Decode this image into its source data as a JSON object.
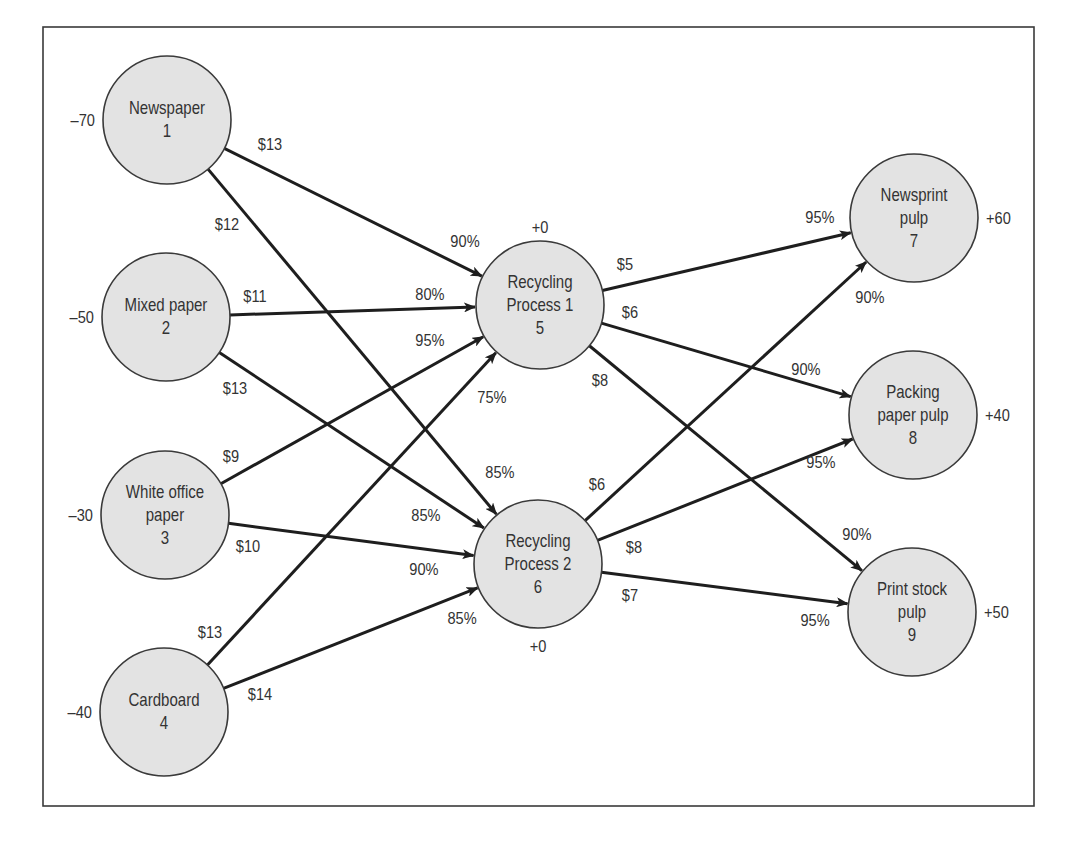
{
  "diagram": {
    "frame": {
      "x": 43,
      "y": 27,
      "width": 991,
      "height": 779
    },
    "colors": {
      "node_fill": "#e3e3e3",
      "stroke": "#3a3a3a",
      "edge": "#1e1e1e",
      "text": "#333333"
    },
    "node_radius": 64,
    "nodes": [
      {
        "id": 1,
        "lines": [
          "Newspaper",
          "1"
        ],
        "x": 167,
        "y": 120,
        "supply": "–70",
        "supply_pos": "left"
      },
      {
        "id": 2,
        "lines": [
          "Mixed paper",
          "2"
        ],
        "x": 166,
        "y": 317,
        "supply": "–50",
        "supply_pos": "left"
      },
      {
        "id": 3,
        "lines": [
          "White office",
          "paper",
          "3"
        ],
        "x": 165,
        "y": 515,
        "supply": "–30",
        "supply_pos": "left"
      },
      {
        "id": 4,
        "lines": [
          "Cardboard",
          "4"
        ],
        "x": 164,
        "y": 712,
        "supply": "–40",
        "supply_pos": "left"
      },
      {
        "id": 5,
        "lines": [
          "Recycling",
          "Process 1",
          "5"
        ],
        "x": 540,
        "y": 305,
        "supply": "+0",
        "supply_pos": "top"
      },
      {
        "id": 6,
        "lines": [
          "Recycling",
          "Process 2",
          "6"
        ],
        "x": 538,
        "y": 564,
        "supply": "+0",
        "supply_pos": "bottom"
      },
      {
        "id": 7,
        "lines": [
          "Newsprint",
          "pulp",
          "7"
        ],
        "x": 914,
        "y": 218,
        "supply": "+60",
        "supply_pos": "right"
      },
      {
        "id": 8,
        "lines": [
          "Packing",
          "paper pulp",
          "8"
        ],
        "x": 913,
        "y": 415,
        "supply": "+40",
        "supply_pos": "right"
      },
      {
        "id": 9,
        "lines": [
          "Print stock",
          "pulp",
          "9"
        ],
        "x": 912,
        "y": 612,
        "supply": "+50",
        "supply_pos": "right"
      }
    ],
    "edges": [
      {
        "from": 1,
        "to": 5,
        "cost": "$13",
        "yield": "90%",
        "cost_xy": [
          270,
          150
        ],
        "yield_xy": [
          465,
          247
        ]
      },
      {
        "from": 1,
        "to": 6,
        "cost": "$12",
        "yield": "85%",
        "cost_xy": [
          227,
          230
        ],
        "yield_xy": [
          500,
          478
        ]
      },
      {
        "from": 2,
        "to": 5,
        "cost": "$11",
        "yield": "80%",
        "cost_xy": [
          255,
          302
        ],
        "yield_xy": [
          430,
          300
        ]
      },
      {
        "from": 2,
        "to": 6,
        "cost": "$13",
        "yield": "85%",
        "cost_xy": [
          235,
          394
        ],
        "yield_xy": [
          426,
          521
        ]
      },
      {
        "from": 3,
        "to": 5,
        "cost": "$9",
        "yield": "95%",
        "cost_xy": [
          231,
          462
        ],
        "yield_xy": [
          430,
          346
        ]
      },
      {
        "from": 3,
        "to": 6,
        "cost": "$10",
        "yield": "90%",
        "cost_xy": [
          248,
          552
        ],
        "yield_xy": [
          424,
          575
        ]
      },
      {
        "from": 4,
        "to": 5,
        "cost": "$13",
        "yield": "75%",
        "cost_xy": [
          210,
          638
        ],
        "yield_xy": [
          492,
          403
        ]
      },
      {
        "from": 4,
        "to": 6,
        "cost": "$14",
        "yield": "85%",
        "cost_xy": [
          260,
          700
        ],
        "yield_xy": [
          462,
          624
        ]
      },
      {
        "from": 5,
        "to": 7,
        "cost": "$5",
        "yield": "95%",
        "cost_xy": [
          625,
          270
        ],
        "yield_xy": [
          820,
          223
        ]
      },
      {
        "from": 5,
        "to": 8,
        "cost": "$6",
        "yield": "90%",
        "cost_xy": [
          630,
          318
        ],
        "yield_xy": [
          806,
          375
        ]
      },
      {
        "from": 5,
        "to": 9,
        "cost": "$8",
        "yield": "90%",
        "cost_xy": [
          600,
          386
        ],
        "yield_xy": [
          857,
          540
        ]
      },
      {
        "from": 6,
        "to": 7,
        "cost": "$6",
        "yield": "90%",
        "cost_xy": [
          597,
          490
        ],
        "yield_xy": [
          870,
          303
        ]
      },
      {
        "from": 6,
        "to": 8,
        "cost": "$8",
        "yield": "95%",
        "cost_xy": [
          634,
          553
        ],
        "yield_xy": [
          821,
          468
        ]
      },
      {
        "from": 6,
        "to": 9,
        "cost": "$7",
        "yield": "95%",
        "cost_xy": [
          630,
          601
        ],
        "yield_xy": [
          815,
          626
        ]
      }
    ]
  }
}
